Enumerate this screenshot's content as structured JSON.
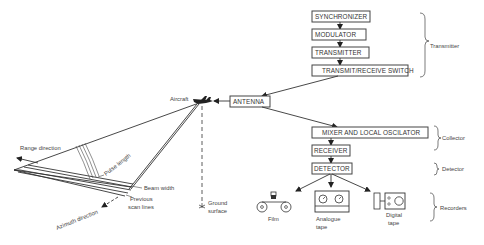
{
  "diagram": {
    "transmitter_chain": [
      {
        "id": "synchronizer",
        "label": "SYNCHRONIZER"
      },
      {
        "id": "modulator",
        "label": "MODULATOR"
      },
      {
        "id": "transmitter",
        "label": "TRANSMITTER"
      },
      {
        "id": "tr_switch",
        "label": "TRANSMIT/RECEIVE SWITCH"
      }
    ],
    "antenna": {
      "label": "ANTENNA"
    },
    "receiver_chain": [
      {
        "id": "mixer",
        "label": "MIXER AND LOCAL OSCILATOR"
      },
      {
        "id": "receiver",
        "label": "RECEIVER"
      },
      {
        "id": "detector",
        "label": "DETECTOR"
      }
    ],
    "recorders": [
      {
        "id": "film",
        "label": "Film"
      },
      {
        "id": "analogue",
        "label_line1": "Analogue",
        "label_line2": "tape"
      },
      {
        "id": "digital",
        "label_line1": "Digital",
        "label_line2": "tape"
      }
    ],
    "groups": {
      "transmitter": "Transmitter",
      "collector": "Collector",
      "detector": "Detector",
      "recorders": "Recorders"
    },
    "geometry_labels": {
      "aircraft": "Aircraft",
      "range_direction": "Range direction",
      "pulse_length": "Pulse length",
      "beam_width": "Beam width",
      "previous_scan_lines_1": "Previous",
      "previous_scan_lines_2": "scan lines",
      "azimuth_direction": "Azimuth direction",
      "ground_surface_1": "Ground",
      "ground_surface_2": "surface"
    }
  }
}
